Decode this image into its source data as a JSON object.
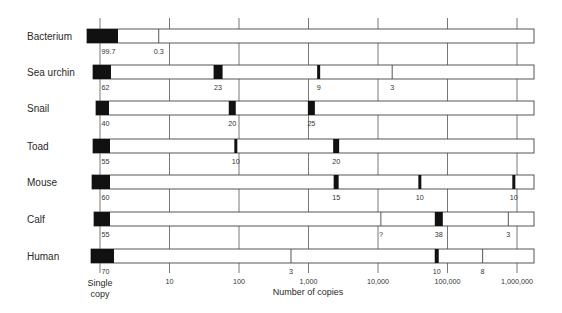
{
  "chart_data": {
    "type": "bar",
    "subtype": "segmented-strip-log-scale",
    "title": "",
    "xlabel": "Number of copies",
    "ylabel": "",
    "xscale": "log",
    "xlim": [
      1,
      1000000
    ],
    "grid": true,
    "legend": null,
    "x_ticks": [
      {
        "value": 1,
        "label": "Single",
        "label2": "copy"
      },
      {
        "value": 10,
        "label": "10"
      },
      {
        "value": 100,
        "label": "100"
      },
      {
        "value": 1000,
        "label": "1,000"
      },
      {
        "value": 10000,
        "label": "10,000"
      },
      {
        "value": 100000,
        "label": "100,000"
      },
      {
        "value": 1000000,
        "label": "1,000,000"
      }
    ],
    "categories": [
      "Bacterium",
      "Sea urchin",
      "Snail",
      "Toad",
      "Mouse",
      "Calf",
      "Human"
    ],
    "rows": [
      {
        "label": "Bacterium",
        "components": [
          {
            "copies": 1,
            "percent": "99.7",
            "mark": "block"
          },
          {
            "copies": 7,
            "percent": "0.3",
            "mark": "line"
          }
        ]
      },
      {
        "label": "Sea urchin",
        "components": [
          {
            "copies": 1,
            "percent": "62",
            "mark": "block"
          },
          {
            "copies": 50,
            "percent": "23",
            "mark": "block",
            "w": 9
          },
          {
            "copies": 1400,
            "percent": "9",
            "mark": "block",
            "w": 3
          },
          {
            "copies": 16000,
            "percent": "3",
            "mark": "line"
          }
        ]
      },
      {
        "label": "Snail",
        "components": [
          {
            "copies": 1,
            "percent": "40",
            "mark": "block"
          },
          {
            "copies": 80,
            "percent": "20",
            "mark": "block",
            "w": 7
          },
          {
            "copies": 1100,
            "percent": "25",
            "mark": "block",
            "w": 7
          }
        ]
      },
      {
        "label": "Toad",
        "components": [
          {
            "copies": 1,
            "percent": "55",
            "mark": "block"
          },
          {
            "copies": 90,
            "percent": "10",
            "mark": "block",
            "w": 3
          },
          {
            "copies": 2500,
            "percent": "20",
            "mark": "block",
            "w": 6
          }
        ]
      },
      {
        "label": "Mouse",
        "components": [
          {
            "copies": 1,
            "percent": "60",
            "mark": "block"
          },
          {
            "copies": 2500,
            "percent": "15",
            "mark": "block",
            "w": 5
          },
          {
            "copies": 40000,
            "percent": "10",
            "mark": "block",
            "w": 3
          },
          {
            "copies": 900000,
            "percent": "10",
            "mark": "block",
            "w": 3
          }
        ]
      },
      {
        "label": "Calf",
        "components": [
          {
            "copies": 1,
            "percent": "55",
            "mark": "block"
          },
          {
            "copies": 11000,
            "percent": "?",
            "mark": "line"
          },
          {
            "copies": 75000,
            "percent": "38",
            "mark": "block",
            "w": 8
          },
          {
            "copies": 750000,
            "percent": "3",
            "mark": "line"
          }
        ]
      },
      {
        "label": "Human",
        "components": [
          {
            "copies": 1,
            "percent": "70",
            "mark": "block"
          },
          {
            "copies": 560,
            "percent": "3",
            "mark": "line"
          },
          {
            "copies": 70000,
            "percent": "10",
            "mark": "block",
            "w": 4
          },
          {
            "copies": 320000,
            "percent": "8",
            "mark": "line"
          }
        ]
      }
    ]
  }
}
